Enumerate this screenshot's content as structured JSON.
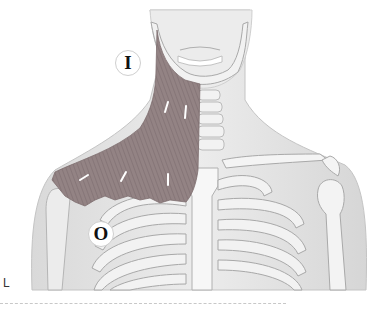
{
  "figure": {
    "labels": {
      "insertion": "I",
      "origin": "O"
    },
    "side_marker": "L",
    "colors": {
      "muscle": "#8f7f80",
      "muscle_fiber": "#7a6a6c",
      "skin": "#e6e6e6",
      "skin_shadow": "#cdcdcd",
      "bone": "#f4f4f4",
      "bone_outline": "#a9a9a9",
      "arrow": "#ffffff"
    }
  }
}
